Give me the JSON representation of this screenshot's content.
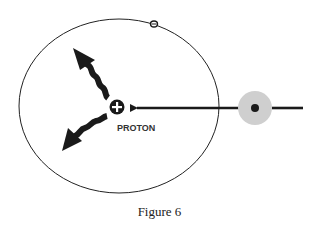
{
  "diagram": {
    "proton_label": "PROTON",
    "proton_symbol": "+",
    "electron_symbol": "−",
    "caption": "Figure 6",
    "colors": {
      "ink": "#1a1a1a",
      "orbit": "#222222",
      "incoming_particle_halo": "#cfcfcf",
      "background": "#ffffff"
    },
    "elements": [
      "orbit-ellipse",
      "electron",
      "proton",
      "emitted-wave-arrow-up-left",
      "emitted-wave-arrow-down-left",
      "incoming-particle",
      "incoming-track-arrow"
    ]
  }
}
